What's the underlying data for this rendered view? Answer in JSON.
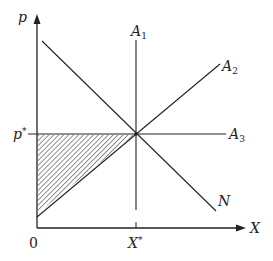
{
  "diagram": {
    "type": "economics-supply-demand-diagram",
    "axes": {
      "y_label": "p",
      "x_label": "X",
      "origin_label": "0"
    },
    "equilibrium": {
      "price_label": "p",
      "price_superscript": "*",
      "quantity_label": "X",
      "quantity_superscript": "*"
    },
    "lines": [
      {
        "id": "A1",
        "label": "A",
        "subscript": "1",
        "kind": "vertical"
      },
      {
        "id": "A2",
        "label": "A",
        "subscript": "2",
        "kind": "upward-sloping"
      },
      {
        "id": "A3",
        "label": "A",
        "subscript": "3",
        "kind": "horizontal"
      },
      {
        "id": "N",
        "label": "N",
        "subscript": "",
        "kind": "downward-sloping"
      }
    ],
    "shaded_region": "triangle between p* line, p-axis and A2 line (hatched)"
  },
  "colors": {
    "line": "#222222",
    "background": "#ffffff"
  }
}
